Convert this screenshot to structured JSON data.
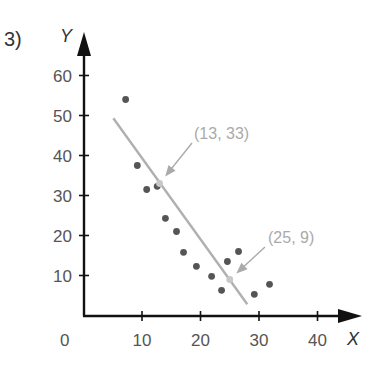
{
  "problem_label": "3)",
  "chart_data": {
    "type": "scatter",
    "title": "",
    "xlabel": "X",
    "ylabel": "Y",
    "xlim": [
      0,
      45
    ],
    "ylim": [
      0,
      65
    ],
    "grid": false,
    "x_ticks": [
      10,
      20,
      30,
      40
    ],
    "y_ticks": [
      10,
      20,
      30,
      40,
      50,
      60
    ],
    "origin_label": "0",
    "tick_labels": {
      "x": [
        "10",
        "20",
        "30",
        "40"
      ],
      "y": [
        "10",
        "20",
        "30",
        "40",
        "50",
        "60"
      ]
    },
    "series": [
      {
        "name": "data points",
        "points": [
          {
            "x": 7.2,
            "y": 54
          },
          {
            "x": 9.2,
            "y": 37.5
          },
          {
            "x": 10.8,
            "y": 31.5
          },
          {
            "x": 12.6,
            "y": 32.3
          },
          {
            "x": 14.0,
            "y": 24.3
          },
          {
            "x": 15.9,
            "y": 21
          },
          {
            "x": 17.1,
            "y": 15.8
          },
          {
            "x": 19.3,
            "y": 12.3
          },
          {
            "x": 21.9,
            "y": 9.8
          },
          {
            "x": 23.6,
            "y": 6.3
          },
          {
            "x": 24.6,
            "y": 13.5
          },
          {
            "x": 26.5,
            "y": 16
          },
          {
            "x": 29.2,
            "y": 5.3
          },
          {
            "x": 31.8,
            "y": 7.8
          }
        ]
      }
    ],
    "fit_line": {
      "from": {
        "x": 5.1,
        "y": 49.3
      },
      "to": {
        "x": 28.0,
        "y": 2.8
      },
      "slope": -2
    },
    "annotations": [
      {
        "text": "(13, 33)",
        "point": {
          "x": 13,
          "y": 33
        }
      },
      {
        "text": "(25, 9)",
        "point": {
          "x": 25,
          "y": 9
        }
      }
    ],
    "colors": {
      "axis": "#111111",
      "points": "#555555",
      "fit_line": "#b0b0b0",
      "annotation": "#aaaaaa"
    }
  }
}
